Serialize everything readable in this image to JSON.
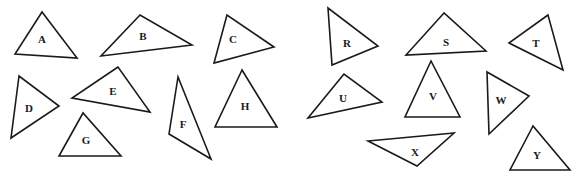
{
  "diagram": {
    "background": "#ffffff",
    "stroke_color": "#1a1a1a",
    "triangles": [
      {
        "label": "A",
        "points": [
          [
            42,
            12
          ],
          [
            15,
            54
          ],
          [
            77,
            58
          ]
        ],
        "label_pos": [
          42,
          40
        ]
      },
      {
        "label": "B",
        "points": [
          [
            140,
            15
          ],
          [
            101,
            56
          ],
          [
            192,
            45
          ]
        ],
        "label_pos": [
          143,
          37
        ]
      },
      {
        "label": "C",
        "points": [
          [
            227,
            15
          ],
          [
            214,
            63
          ],
          [
            274,
            47
          ]
        ],
        "label_pos": [
          233,
          40
        ]
      },
      {
        "label": "D",
        "points": [
          [
            19,
            76
          ],
          [
            11,
            138
          ],
          [
            59,
            106
          ]
        ],
        "label_pos": [
          29,
          109
        ]
      },
      {
        "label": "E",
        "points": [
          [
            118,
            67
          ],
          [
            72,
            98
          ],
          [
            150,
            112
          ]
        ],
        "label_pos": [
          113,
          92
        ]
      },
      {
        "label": "F",
        "points": [
          [
            178,
            77
          ],
          [
            169,
            134
          ],
          [
            211,
            159
          ]
        ],
        "label_pos": [
          183,
          125
        ]
      },
      {
        "label": "G",
        "points": [
          [
            83,
            113
          ],
          [
            59,
            156
          ],
          [
            121,
            156
          ]
        ],
        "label_pos": [
          86,
          141
        ]
      },
      {
        "label": "H",
        "points": [
          [
            242,
            70
          ],
          [
            215,
            127
          ],
          [
            277,
            127
          ]
        ],
        "label_pos": [
          245,
          107
        ]
      },
      {
        "label": "R",
        "points": [
          [
            328,
            8
          ],
          [
            332,
            65
          ],
          [
            378,
            46
          ]
        ],
        "label_pos": [
          347,
          44
        ]
      },
      {
        "label": "S",
        "points": [
          [
            444,
            13
          ],
          [
            406,
            55
          ],
          [
            486,
            51
          ]
        ],
        "label_pos": [
          446,
          43
        ]
      },
      {
        "label": "T",
        "points": [
          [
            548,
            15
          ],
          [
            509,
            43
          ],
          [
            563,
            70
          ]
        ],
        "label_pos": [
          536,
          44
        ]
      },
      {
        "label": "U",
        "points": [
          [
            344,
            74
          ],
          [
            308,
            118
          ],
          [
            382,
            102
          ]
        ],
        "label_pos": [
          343,
          99
        ]
      },
      {
        "label": "V",
        "points": [
          [
            431,
            61
          ],
          [
            405,
            117
          ],
          [
            460,
            117
          ]
        ],
        "label_pos": [
          433,
          97
        ]
      },
      {
        "label": "W",
        "points": [
          [
            487,
            72
          ],
          [
            489,
            134
          ],
          [
            529,
            96
          ]
        ],
        "label_pos": [
          501,
          101
        ]
      },
      {
        "label": "X",
        "points": [
          [
            368,
            141
          ],
          [
            454,
            133
          ],
          [
            417,
            166
          ]
        ],
        "label_pos": [
          415,
          153
        ]
      },
      {
        "label": "Y",
        "points": [
          [
            533,
            126
          ],
          [
            510,
            170
          ],
          [
            570,
            170
          ]
        ],
        "label_pos": [
          537,
          156
        ]
      }
    ]
  }
}
